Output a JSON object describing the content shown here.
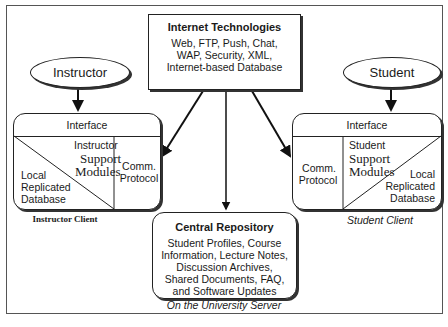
{
  "internet": {
    "title": "Internet Technologies",
    "lines": [
      "Web, FTP, Push, Chat,",
      "WAP, Security, XML,",
      "Internet-based Database"
    ]
  },
  "actors": {
    "instructor": "Instructor",
    "student": "Student"
  },
  "instructor_client": {
    "interface": "Interface",
    "support_label": "Instructor",
    "support_modules": [
      "Support",
      "Modules"
    ],
    "comm": [
      "Comm.",
      "Protocol"
    ],
    "local_db": [
      "Local",
      "Replicated",
      "Database"
    ],
    "caption": "Instructor Client"
  },
  "student_client": {
    "interface": "Interface",
    "support_label": "Student",
    "support_modules": [
      "Support",
      "Modules"
    ],
    "comm": [
      "Comm.",
      "Protocol"
    ],
    "local_db": [
      "Local",
      "Replicated",
      "Database"
    ],
    "caption": "Student Client"
  },
  "repository": {
    "title": "Central Repository",
    "lines": [
      "Student Profiles, Course",
      "Information, Lecture Notes,",
      "Discussion Archives,",
      "Shared Documents, FAQ,",
      "and Software Updates"
    ],
    "caption": "On the University Server"
  }
}
